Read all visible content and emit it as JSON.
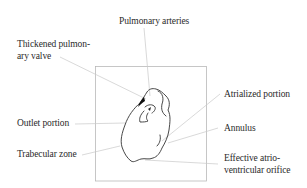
{
  "diagram": {
    "colors": {
      "background": "#ffffff",
      "frame": "#b8b8b8",
      "leader": "#c8c8c8",
      "outline": "#333333",
      "text": "#2a2a2a"
    },
    "labels": {
      "pulmonary_arteries": "Pulmonary arteries",
      "thickened_valve_line1": "Thickened pulmon-",
      "thickened_valve_line2": "ary valve",
      "atrialized_portion": "Atrialized portion",
      "annulus": "Annulus",
      "outlet_portion": "Outlet portion",
      "trabecular_zone": "Trabecular zone",
      "effective_orifice_line1": "Effective atrio-",
      "effective_orifice_line2": "ventricular orifice"
    }
  }
}
